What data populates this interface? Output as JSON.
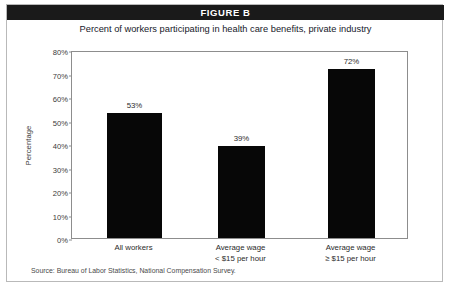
{
  "figure": {
    "banner_label": "FIGURE B",
    "source_note": "Source:  Bureau of Labor Statistics, National Compensation Survey."
  },
  "chart_data": {
    "type": "bar",
    "title": "Percent of workers participating in health care benefits, private industry",
    "xlabel": "",
    "ylabel": "Percentage",
    "categories": [
      "All workers",
      "Average wage\n< $15 per hour",
      "Average wage\n≥ $15 per hour"
    ],
    "category_lines": [
      [
        "All workers"
      ],
      [
        "Average wage",
        "< $15 per hour"
      ],
      [
        "Average wage",
        "≥ $15 per hour"
      ]
    ],
    "values": [
      53,
      39,
      72
    ],
    "value_labels": [
      "53%",
      "39%",
      "72%"
    ],
    "ylim": [
      0,
      80
    ],
    "yticks": [
      80,
      70,
      60,
      50,
      40,
      30,
      20,
      10,
      0
    ],
    "ytick_labels": [
      "80%",
      "70%",
      "60%",
      "50%",
      "40%",
      "30%",
      "20%",
      "10%",
      "0%"
    ],
    "grid": false,
    "legend": null,
    "bar_color": "#070707",
    "plot_border_color": "#8d8d8d",
    "banner_color": "#1a1a1a"
  }
}
